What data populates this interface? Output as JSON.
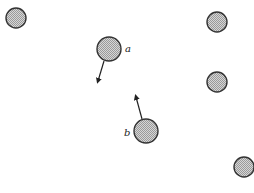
{
  "diagram": {
    "colors": {
      "background": "#ffffff",
      "circle_fill": "#bdbdbd",
      "circle_stroke": "#333333",
      "arrow": "#222222"
    },
    "particles": [
      {
        "id": "p1",
        "cx": 16,
        "cy": 18,
        "r": 10,
        "label": ""
      },
      {
        "id": "a",
        "cx": 109,
        "cy": 49,
        "r": 12,
        "label": "a"
      },
      {
        "id": "p3",
        "cx": 217,
        "cy": 22,
        "r": 10,
        "label": ""
      },
      {
        "id": "p4",
        "cx": 217,
        "cy": 82,
        "r": 10,
        "label": ""
      },
      {
        "id": "b",
        "cx": 146,
        "cy": 131,
        "r": 12,
        "label": "b"
      },
      {
        "id": "p6",
        "cx": 244,
        "cy": 167,
        "r": 10,
        "label": ""
      }
    ],
    "labels": {
      "a": "a",
      "b": "b"
    },
    "arrows": [
      {
        "from_particle": "a",
        "x1": 104,
        "y1": 61,
        "x2": 98,
        "y2": 81,
        "direction": "down-left"
      },
      {
        "from_particle": "b",
        "x1": 142,
        "y1": 119,
        "x2": 136,
        "y2": 97,
        "direction": "up-left"
      }
    ]
  }
}
